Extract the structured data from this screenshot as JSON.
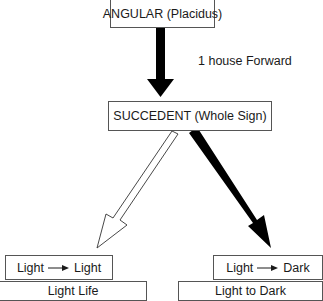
{
  "diagram": {
    "top_node": {
      "label": "ANGULAR (Placidus)"
    },
    "edge_top": {
      "label": "1 house Forward",
      "style": "solid-black"
    },
    "middle_node": {
      "label": "SUCCEDENT (Whole Sign)"
    },
    "edge_left": {
      "style": "hollow"
    },
    "edge_right": {
      "style": "solid-black"
    },
    "left_node": {
      "from": "Light",
      "to": "Light",
      "arrow": "→"
    },
    "right_node": {
      "from": "Light",
      "to": "Dark",
      "arrow": "→"
    },
    "left_cut_node": {
      "label": "Light Life"
    },
    "right_cut_node": {
      "label": "Light to Dark"
    }
  },
  "colors": {
    "border": "#555555",
    "arrow_fill": "#000000",
    "hollow_fill": "#ffffff",
    "text": "#1a1a1a"
  }
}
